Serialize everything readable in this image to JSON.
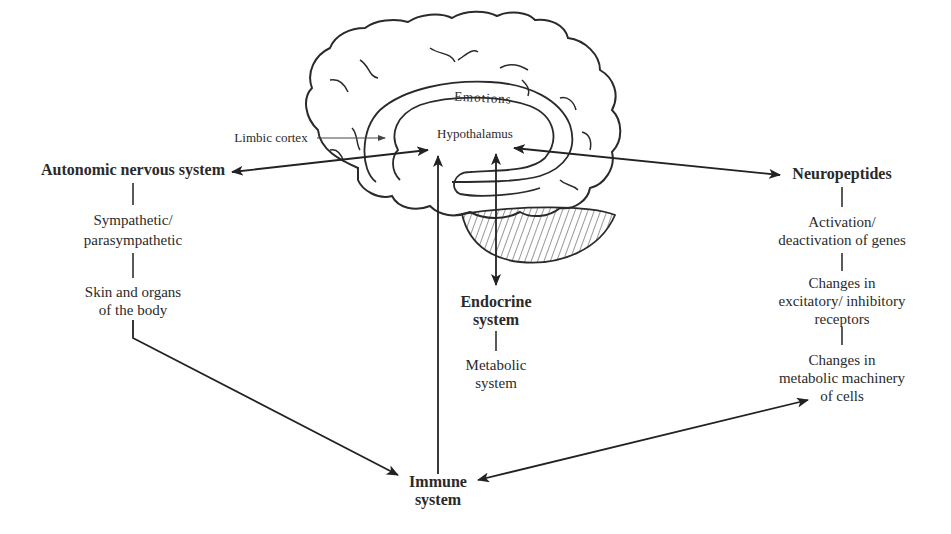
{
  "diagram": {
    "type": "mind-body feedback diagram",
    "brain": {
      "labels": {
        "emotions": "Emotions",
        "hypothalamus": "Hypothalamus",
        "limbic_cortex": "Limbic cortex"
      }
    },
    "nodes": {
      "autonomic": {
        "title": "Autonomic nervous system",
        "chain": [
          "Sympathetic/",
          "parasympathetic",
          "Skin and organs",
          "of the body"
        ]
      },
      "neuropeptides": {
        "title": "Neuropeptides",
        "chain": [
          "Activation/",
          "deactivation of genes",
          "Changes in",
          "excitatory/ inhibitory",
          "receptors",
          "Changes in",
          "metabolic machinery",
          "of cells"
        ]
      },
      "endocrine": {
        "title_line1": "Endocrine",
        "title_line2": "system",
        "chain": [
          "Metabolic",
          "system"
        ]
      },
      "immune": {
        "title_line1": "Immune",
        "title_line2": "system"
      }
    },
    "edges": [
      {
        "from": "Hypothalamus",
        "to": "Autonomic nervous system",
        "direction": "bidirectional"
      },
      {
        "from": "Hypothalamus",
        "to": "Neuropeptides",
        "direction": "bidirectional"
      },
      {
        "from": "Hypothalamus",
        "to": "Endocrine system",
        "direction": "bidirectional"
      },
      {
        "from": "Immune system",
        "to": "Hypothalamus",
        "direction": "one-way"
      },
      {
        "from": "Skin and organs of the body",
        "to": "Immune system",
        "direction": "one-way"
      },
      {
        "from": "Immune system",
        "to": "Changes in metabolic machinery of cells",
        "direction": "bidirectional"
      },
      {
        "from": "Limbic cortex",
        "to": "Hypothalamus region",
        "direction": "pointer"
      }
    ]
  }
}
